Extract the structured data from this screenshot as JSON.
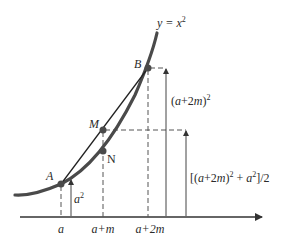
{
  "curve": {
    "label_y": "y",
    "label_eq": " = x",
    "label_exp": "2"
  },
  "points": {
    "A": {
      "label": "A",
      "x": 61,
      "y": 184
    },
    "B": {
      "label": "B",
      "x": 148,
      "y": 68
    },
    "M": {
      "label": "M",
      "x": 103,
      "y": 130
    },
    "N": {
      "label": "N",
      "x": 103,
      "y": 151
    }
  },
  "x_axis": {
    "ticks": [
      {
        "label": "a"
      },
      {
        "label": "a+m"
      },
      {
        "label": "a+2m"
      }
    ]
  },
  "annotations": {
    "a_squared": {
      "base": "a",
      "exp": "2"
    },
    "b_height": {
      "open": "(",
      "base": "a",
      "mid": "+2",
      "m": "m",
      "close": ")",
      "exp": "2"
    },
    "m_height": {
      "open": "[(",
      "base": "a",
      "mid": "+2",
      "m": "m",
      "close": ")",
      "exp1": "2",
      "plus": " + ",
      "a2": "a",
      "exp2": "2",
      "tail": "]/2"
    }
  },
  "colors": {
    "curve": "#4a4a4a",
    "lines": "#333333",
    "text": "#2a2a2a"
  }
}
